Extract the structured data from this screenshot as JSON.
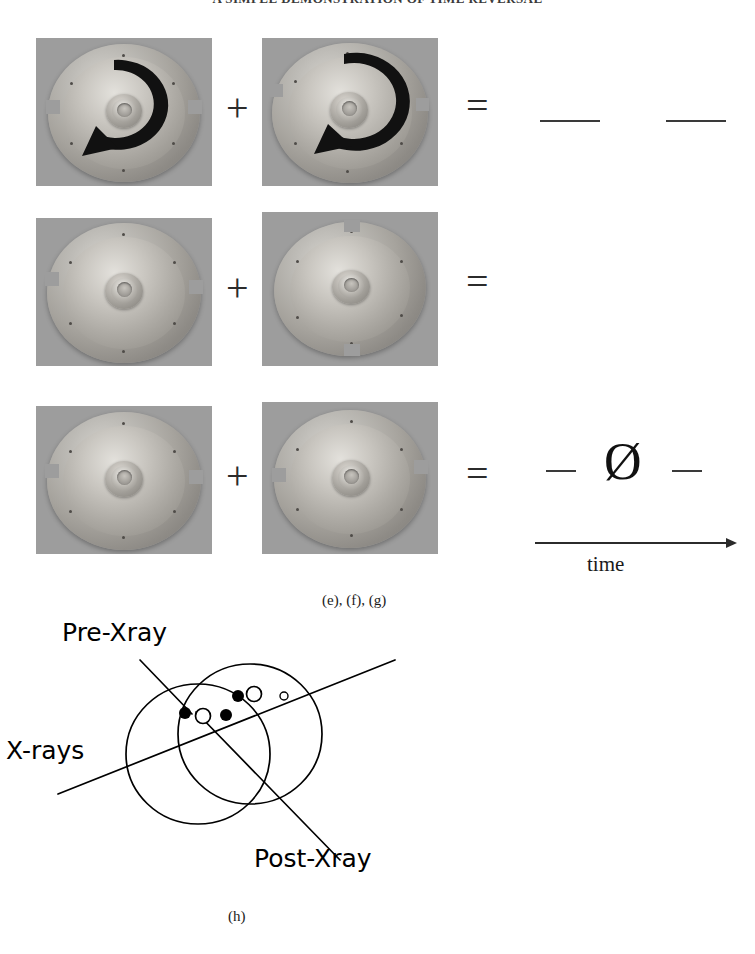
{
  "page": {
    "running_header": "A SIMPLE DEMONSTRATION OF TIME REVERSAL",
    "background": "#ffffff"
  },
  "figure_equations": {
    "operators": {
      "plus": "+",
      "equals": "="
    },
    "rows": [
      {
        "id": "row-1",
        "left_panel": {
          "name": "rotor-disc-with-arrow-left",
          "alt": "machined aluminium rotor disc photographed from above with a large black curved arrow indicating clockwise rotation",
          "has_arrow": true,
          "arrow_direction": "clockwise"
        },
        "right_panel": {
          "name": "rotor-disc-with-arrow-right",
          "alt": "same rotor disc with a large black curved arrow indicating counter rotation",
          "has_arrow": true,
          "arrow_direction": "clockwise"
        },
        "result": {
          "type": "dashes",
          "segments": 2
        }
      },
      {
        "id": "row-2",
        "left_panel": {
          "name": "rotor-disc-plain-left",
          "alt": "rotor disc photographed flat with no arrow overlay",
          "has_arrow": false
        },
        "right_panel": {
          "name": "rotor-disc-tilted-right",
          "alt": "rotor disc photographed at a tilted angle with no arrow overlay",
          "has_arrow": false
        },
        "result": {
          "type": "dashes",
          "segments": 2
        }
      },
      {
        "id": "row-3",
        "left_panel": {
          "name": "rotor-disc-plain-left-2",
          "alt": "rotor disc photographed flat with no arrow overlay",
          "has_arrow": false
        },
        "right_panel": {
          "name": "rotor-disc-plain-right-2",
          "alt": "rotor disc photographed flat, rotated orientation, with no arrow overlay",
          "has_arrow": false
        },
        "result": {
          "type": "symbol",
          "symbol": "Ø"
        }
      }
    ],
    "time_axis": {
      "label": "time",
      "direction": "left-to-right"
    },
    "caption": "(e), (f), (g)"
  },
  "figure_diagram": {
    "caption": "(h)",
    "labels": {
      "pre_xray": "Pre-Xray",
      "xrays": "X-rays",
      "post_xray": "Post-Xray"
    },
    "elements": {
      "circles": 2,
      "filled_markers": 3,
      "open_markers": 3
    }
  },
  "colors": {
    "ink": "#1a1a1a",
    "photo_background": "#9d9d9d",
    "line": "#000000",
    "page": "#ffffff"
  }
}
